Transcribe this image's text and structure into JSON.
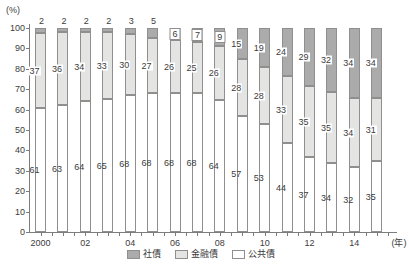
{
  "chart_data": {
    "type": "bar",
    "stacked": true,
    "title": "",
    "y_axis_label": "(%)",
    "x_axis_suffix": "(年)",
    "ylim": [
      0,
      100
    ],
    "y_ticks": [
      0,
      10,
      20,
      30,
      40,
      50,
      60,
      70,
      80,
      90,
      100
    ],
    "grid": false,
    "categories": [
      "2000",
      "01",
      "02",
      "03",
      "04",
      "05",
      "06",
      "07",
      "08",
      "09",
      "10",
      "11",
      "12",
      "13",
      "14",
      "15"
    ],
    "x_tick_labels": [
      "2000",
      "02",
      "04",
      "06",
      "08",
      "10",
      "12",
      "14"
    ],
    "series": [
      {
        "name": "公共債",
        "color": "#ffffff",
        "values": [
          61,
          63,
          64,
          65,
          68,
          68,
          68,
          68,
          64,
          57,
          53,
          44,
          37,
          34,
          32,
          35
        ]
      },
      {
        "name": "金融債",
        "color": "#e4e4e2",
        "values": [
          37,
          36,
          34,
          33,
          30,
          27,
          26,
          25,
          26,
          28,
          28,
          33,
          35,
          35,
          34,
          31
        ]
      },
      {
        "name": "社債",
        "color": "#ababab",
        "values": [
          2,
          2,
          2,
          2,
          3,
          5,
          6,
          7,
          9,
          15,
          19,
          24,
          29,
          32,
          34,
          34
        ]
      }
    ],
    "legend": [
      {
        "label": "社債",
        "color": "#ababab"
      },
      {
        "label": "金融債",
        "color": "#e4e4e2"
      },
      {
        "label": "公共債",
        "color": "#ffffff"
      }
    ],
    "legend_position": "bottom"
  },
  "colors": {
    "axis": "#7d7d7d",
    "segment_border": "#8f8f8f",
    "text": "#3c3c3c",
    "background": "#ffffff"
  }
}
